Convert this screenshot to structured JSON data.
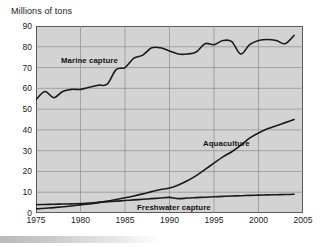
{
  "chart_data": {
    "type": "line",
    "title": "Millions of tons",
    "xlabel": "",
    "ylabel": "Millions of tons",
    "xlim": [
      1975,
      2005
    ],
    "ylim": [
      0,
      90
    ],
    "xticks": [
      1975,
      1980,
      1985,
      1990,
      1995,
      2000,
      2005
    ],
    "yticks": [
      0,
      10,
      20,
      30,
      40,
      50,
      60,
      70,
      80,
      90
    ],
    "grid": true,
    "legend": "inline-annotations",
    "x": [
      1975,
      1976,
      1977,
      1978,
      1979,
      1980,
      1981,
      1982,
      1983,
      1984,
      1985,
      1986,
      1987,
      1988,
      1989,
      1990,
      1991,
      1992,
      1993,
      1994,
      1995,
      1996,
      1997,
      1998,
      1999,
      2000,
      2001,
      2002,
      2003,
      2004
    ],
    "series": [
      {
        "name": "Marine capture",
        "values": [
          54.5,
          58.5,
          55.5,
          58.5,
          59.5,
          59.5,
          60.5,
          61.5,
          62.0,
          69.0,
          70.0,
          74.5,
          76.0,
          79.5,
          79.5,
          78.0,
          76.5,
          76.5,
          77.5,
          81.5,
          81.0,
          83.0,
          82.5,
          76.5,
          81.0,
          83.0,
          83.5,
          83.0,
          81.5,
          85.5
        ]
      },
      {
        "name": "Aquaculture",
        "values": [
          2.0,
          2.3,
          2.6,
          3.0,
          3.4,
          3.9,
          4.4,
          5.0,
          5.7,
          6.5,
          7.3,
          8.2,
          9.2,
          10.3,
          11.3,
          12.0,
          13.5,
          15.5,
          18.0,
          21.0,
          24.0,
          27.0,
          29.5,
          32.5,
          36.0,
          38.5,
          40.5,
          42.0,
          43.5,
          45.0
        ]
      },
      {
        "name": "Freshwater capture",
        "values": [
          4.0,
          4.1,
          4.2,
          4.3,
          4.4,
          4.5,
          4.8,
          5.1,
          5.4,
          5.7,
          6.0,
          6.3,
          6.6,
          6.9,
          7.2,
          7.5,
          6.9,
          7.2,
          7.4,
          7.6,
          7.8,
          8.0,
          8.2,
          8.3,
          8.5,
          8.6,
          8.7,
          8.8,
          8.9,
          9.0
        ]
      }
    ],
    "annotations": [
      {
        "text": "Marine capture"
      },
      {
        "text": "Aquaculture"
      },
      {
        "text": "Freshwater capture"
      }
    ],
    "colors": {
      "plot_background": "#d3d3d3",
      "grid": "#8c8c8c",
      "axis": "#5a5a5a",
      "line": "#1a1a1a",
      "text": "#1a1a1a"
    }
  }
}
